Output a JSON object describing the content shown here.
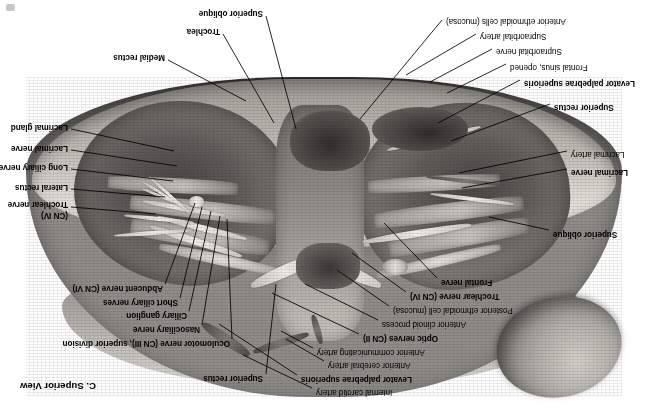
{
  "figure": {
    "title": "C. Superior View",
    "title_pos": {
      "x": 556,
      "y": 27
    },
    "orientation": "rotated-180",
    "canvas": {
      "width": 652,
      "height": 419
    },
    "background_color": "#ffffff",
    "ink_color": "#000000"
  },
  "artifact": {
    "x": 6,
    "y": 4
  },
  "labels": [
    {
      "id": "internal-carotid-artery",
      "text": "Internal carotid artery",
      "bold": false,
      "align": "right",
      "x": 336,
      "y": 27,
      "leader": [
        [
          340,
          31
        ],
        [
          409,
          64
        ]
      ]
    },
    {
      "id": "levator-palpebrae-superioris-top",
      "text": "Levator palpebrae superioris",
      "bold": true,
      "align": "right",
      "x": 351,
      "y": 40,
      "leader": [
        [
          355,
          44
        ],
        [
          433,
          95
        ]
      ]
    },
    {
      "id": "anterior-cerebral-artery",
      "text": "Anterior cerebral artery",
      "bold": false,
      "align": "right",
      "x": 324,
      "y": 54,
      "leader": [
        [
          328,
          58
        ],
        [
          366,
          80
        ]
      ]
    },
    {
      "id": "anterior-communicating-artery",
      "text": "Anterior communicating artery",
      "bold": false,
      "align": "right",
      "x": 335,
      "y": 67,
      "leader": [
        [
          339,
          71
        ],
        [
          371,
          88
        ]
      ]
    },
    {
      "id": "optic-nerves",
      "text": "Optic nerves (CN II)",
      "bold": true,
      "align": "right",
      "x": 289,
      "y": 81,
      "leader": [
        [
          293,
          85
        ],
        [
          380,
          126
        ]
      ]
    },
    {
      "id": "anterior-clinoid-process",
      "text": "Anterior clinoid process",
      "bold": false,
      "align": "right",
      "x": 270,
      "y": 95,
      "leader": [
        [
          274,
          99
        ],
        [
          347,
          135
        ]
      ]
    },
    {
      "id": "posterior-ethmoidal-cell",
      "text": "Posterior ethmoidal cell (mucosa)",
      "bold": false,
      "align": "right",
      "x": 259,
      "y": 109,
      "leader": [
        [
          263,
          113
        ],
        [
          315,
          149
        ]
      ]
    },
    {
      "id": "trochlear-nerve-cn4-left",
      "text": "Trochlear nerve (CN IV)",
      "bold": true,
      "align": "right",
      "x": 242,
      "y": 123,
      "leader": [
        [
          246,
          127
        ],
        [
          300,
          166
        ]
      ]
    },
    {
      "id": "frontal-nerve",
      "text": "Frontal nerve",
      "bold": true,
      "align": "right",
      "x": 211,
      "y": 137,
      "leader": [
        [
          215,
          141
        ],
        [
          268,
          196
        ]
      ]
    },
    {
      "id": "superior-rectus-top",
      "text": "Superior rectus",
      "bold": true,
      "align": "left",
      "x": 389,
      "y": 41,
      "leader": [
        [
          386,
          45
        ],
        [
          376,
          135
        ]
      ]
    },
    {
      "id": "oculomotor-nerve-cn3",
      "text": "Oculomotor nerve (CN III), superior division",
      "bold": true,
      "align": "left",
      "x": 422,
      "y": 76,
      "leader": [
        [
          420,
          80
        ],
        [
          425,
          200
        ]
      ]
    },
    {
      "id": "nasociliary-nerve",
      "text": "Nasociliary nerve",
      "bold": true,
      "align": "left",
      "x": 452,
      "y": 90,
      "leader": [
        [
          450,
          94
        ],
        [
          432,
          203
        ]
      ]
    },
    {
      "id": "ciliary-ganglion",
      "text": "Ciliary ganglion",
      "bold": true,
      "align": "left",
      "x": 465,
      "y": 104,
      "leader": [
        [
          463,
          108
        ],
        [
          441,
          208
        ]
      ]
    },
    {
      "id": "short-ciliary-nerves",
      "text": "Short ciliary nerves",
      "bold": true,
      "align": "left",
      "x": 474,
      "y": 117,
      "leader": [
        [
          472,
          121
        ],
        [
          450,
          212
        ]
      ]
    },
    {
      "id": "abducent-nerve-cn6",
      "text": "Abducent nerve (CN VI)",
      "bold": true,
      "align": "left",
      "x": 489,
      "y": 131,
      "leader": [
        [
          487,
          135
        ],
        [
          457,
          216
        ]
      ]
    },
    {
      "id": "trochlear-nerve-cn4-right",
      "text": "Trochlear nerve",
      "bold": true,
      "align": "left",
      "x": 584,
      "y": 215,
      "leader": [
        [
          581,
          212
        ],
        [
          496,
          205
        ]
      ]
    },
    {
      "id": "trochlear-nerve-cn4-right-line2",
      "text": "(CN IV)",
      "bold": true,
      "align": "left",
      "x": 584,
      "y": 204,
      "leader": null
    },
    {
      "id": "lateral-rectus",
      "text": "Lateral rectus",
      "bold": true,
      "align": "left",
      "x": 584,
      "y": 232,
      "leader": [
        [
          581,
          230
        ],
        [
          487,
          222
        ]
      ]
    },
    {
      "id": "long-ciliary-nerves",
      "text": "Long ciliary nerves",
      "bold": true,
      "align": "left",
      "x": 584,
      "y": 252,
      "leader": [
        [
          581,
          250
        ],
        [
          479,
          238
        ]
      ]
    },
    {
      "id": "lacrimal-nerve-right",
      "text": "Lacrimal nerve",
      "bold": true,
      "align": "left",
      "x": 584,
      "y": 271,
      "leader": [
        [
          581,
          269
        ],
        [
          475,
          253
        ]
      ]
    },
    {
      "id": "lacrimal-gland",
      "text": "Lacrimal gland",
      "bold": true,
      "align": "left",
      "x": 584,
      "y": 292,
      "leader": [
        [
          581,
          290
        ],
        [
          478,
          268
        ]
      ]
    },
    {
      "id": "superior-oblique-left",
      "text": "Superior oblique",
      "bold": true,
      "align": "right",
      "x": 99,
      "y": 185,
      "leader": [
        [
          103,
          189
        ],
        [
          163,
          202
        ]
      ]
    },
    {
      "id": "lacrimal-nerve-left",
      "text": "Lacrimal nerve",
      "bold": true,
      "align": "right",
      "x": 81,
      "y": 247,
      "leader": [
        [
          85,
          250
        ],
        [
          190,
          231
        ]
      ]
    },
    {
      "id": "lacrimal-artery",
      "text": "Lacrimal artery",
      "bold": false,
      "align": "right",
      "x": 81,
      "y": 265,
      "leader": [
        [
          85,
          268
        ],
        [
          193,
          246
        ]
      ]
    },
    {
      "id": "superior-rectus-bottom",
      "text": "Superior rectus",
      "bold": true,
      "align": "right",
      "x": 98,
      "y": 312,
      "leader": [
        [
          102,
          315
        ],
        [
          201,
          278
        ]
      ]
    },
    {
      "id": "levator-palpebrae-superioris-bottom",
      "text": "Levator palpebrae superioris",
      "bold": true,
      "align": "right",
      "x": 128,
      "y": 336,
      "leader": [
        [
          132,
          339
        ],
        [
          214,
          296
        ]
      ]
    },
    {
      "id": "frontal-sinus-opened",
      "text": "Frontal sinus, opened",
      "bold": false,
      "align": "right",
      "x": 142,
      "y": 352,
      "leader": [
        [
          146,
          355
        ],
        [
          205,
          326
        ]
      ]
    },
    {
      "id": "supraorbital-nerve",
      "text": "Supraorbital nerve",
      "bold": false,
      "align": "right",
      "x": 156,
      "y": 368,
      "leader": [
        [
          160,
          370
        ],
        [
          222,
          337
        ]
      ]
    },
    {
      "id": "supraorbital-artery",
      "text": "Supraorbital artery",
      "bold": false,
      "align": "right",
      "x": 172,
      "y": 383,
      "leader": [
        [
          176,
          385
        ],
        [
          246,
          344
        ]
      ]
    },
    {
      "id": "anterior-ethmoidal-cells",
      "text": "Anterior ethmoidal cells (mucosa)",
      "bold": false,
      "align": "right",
      "x": 206,
      "y": 398,
      "leader": [
        [
          210,
          399
        ],
        [
          292,
          300
        ]
      ]
    },
    {
      "id": "medial-rectus",
      "text": "Medial rectus",
      "bold": true,
      "align": "left",
      "x": 487,
      "y": 362,
      "leader": [
        [
          484,
          359
        ],
        [
          406,
          318
        ]
      ]
    },
    {
      "id": "trochlea",
      "text": "Trochlea",
      "bold": true,
      "align": "left",
      "x": 432,
      "y": 388,
      "leader": [
        [
          429,
          385
        ],
        [
          378,
          296
        ]
      ]
    },
    {
      "id": "superior-oblique-bottom",
      "text": "Superior oblique",
      "bold": true,
      "align": "left",
      "x": 389,
      "y": 406,
      "leader": [
        [
          386,
          403
        ],
        [
          356,
          290
        ]
      ]
    }
  ]
}
